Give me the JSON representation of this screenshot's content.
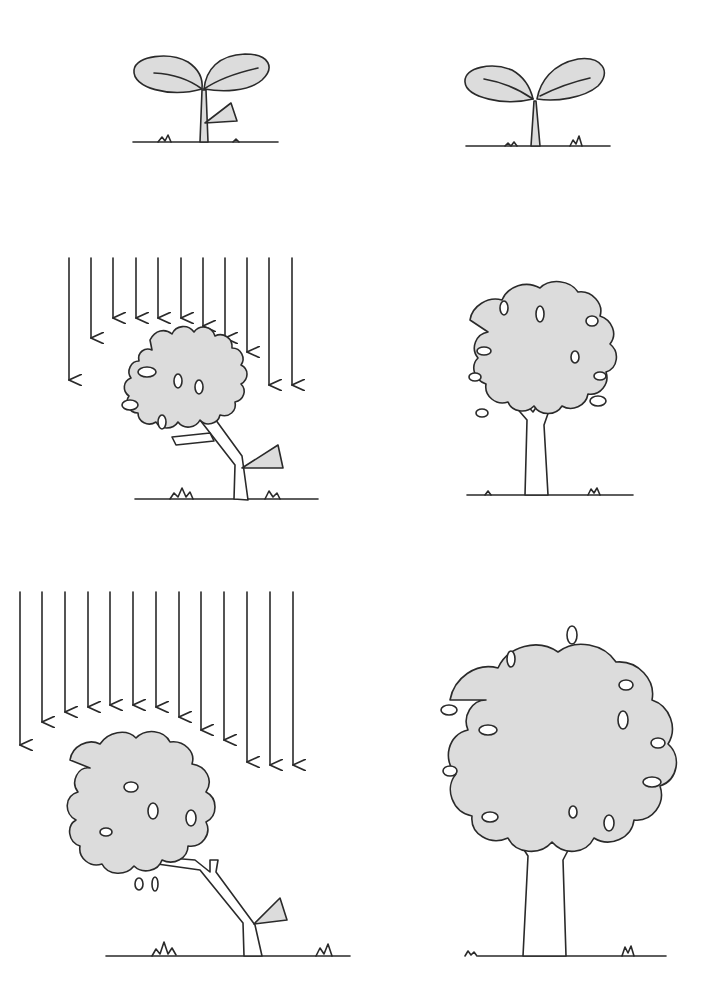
{
  "figure": {
    "layout": "3 rows x 2 columns",
    "colors": {
      "line": "#2a2a2a",
      "foliage": "#dcdcdc",
      "background": "#ffffff"
    },
    "panels": [
      {
        "id": "seedling-with-hormone",
        "row": 1,
        "col": 1,
        "subject": "seedling",
        "light_arrows": 0,
        "triangle_marker": true
      },
      {
        "id": "seedling-control",
        "row": 1,
        "col": 2,
        "subject": "seedling",
        "light_arrows": 0,
        "triangle_marker": false
      },
      {
        "id": "young-tree-under-light",
        "row": 2,
        "col": 1,
        "subject": "leaning young tree",
        "light_arrows": 11,
        "triangle_marker": true
      },
      {
        "id": "young-tree-control",
        "row": 2,
        "col": 2,
        "subject": "upright young tree",
        "light_arrows": 0,
        "triangle_marker": false
      },
      {
        "id": "mature-tree-under-light",
        "row": 3,
        "col": 1,
        "subject": "leaning mature tree",
        "light_arrows": 13,
        "triangle_marker": true
      },
      {
        "id": "mature-tree-control",
        "row": 3,
        "col": 2,
        "subject": "upright mature tree",
        "light_arrows": 0,
        "triangle_marker": false
      }
    ]
  }
}
